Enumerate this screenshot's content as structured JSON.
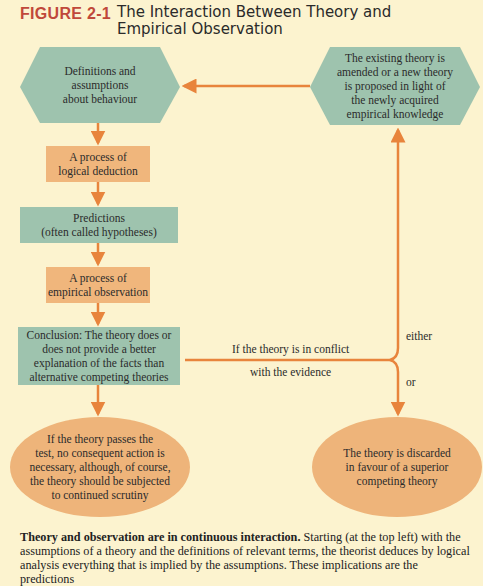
{
  "figure": {
    "label": "FIGURE 2-1",
    "title": "The Interaction Between Theory and Empirical Observation"
  },
  "colors": {
    "background": "#fcf3cf",
    "green_node": "#9ec3ae",
    "orange_node": "#f0b67c",
    "arrow": "#e8843c",
    "figure_label": "#c0483a"
  },
  "nodes": {
    "definitions": "Definitions and assumptions about behaviour",
    "definitions_lines": [
      "Definitions and",
      "assumptions",
      "about behaviour"
    ],
    "amended": "The existing theory is amended or a new theory is proposed in light of the newly acquired empirical knowledge",
    "amended_lines": [
      "The existing theory is",
      "amended or a new theory",
      "is proposed in light of",
      "the newly acquired",
      "empirical knowledge"
    ],
    "logical_deduction_lines": [
      "A process of",
      "logical deduction"
    ],
    "predictions_lines": [
      "Predictions",
      "(often called hypotheses)"
    ],
    "empirical_observation_lines": [
      "A process of",
      "empirical observation"
    ],
    "conclusion_lines": [
      "Conclusion: The theory does or",
      "does not provide a better",
      "explanation of the facts than",
      "alternative competing theories"
    ],
    "passes_lines": [
      "If the theory passes the",
      "test, no consequent action is",
      "necessary, although, of course,",
      "the theory should be subjected",
      "to continued scrutiny"
    ],
    "discarded_lines": [
      "The theory is discarded",
      "in favour of a superior",
      "competing theory"
    ]
  },
  "edge_labels": {
    "conflict_top": "If the theory is in conflict",
    "conflict_bottom": "with the evidence",
    "either": "either",
    "or": "or"
  },
  "caption": {
    "bold": "Theory and observation are in continuous interaction.",
    "text": " Starting (at the top left) with the assumptions of a theory and the definitions of relevant terms, the theorist deduces by logical analysis everything that is implied by the assumptions. These implications are the predictions"
  }
}
